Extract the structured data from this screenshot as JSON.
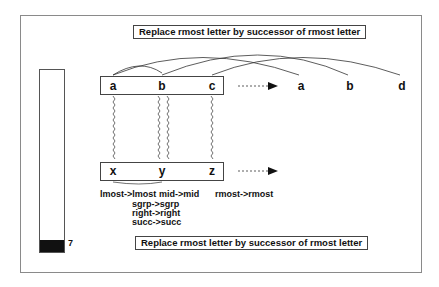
{
  "rule_top": "Replace rmost letter by successor of rmost letter",
  "rule_bottom": "Replace rmost letter by successor of rmost letter",
  "temperature": {
    "value": "7",
    "fill_percent": 7
  },
  "initial_string": [
    "a",
    "b",
    "c"
  ],
  "modified_string": [
    "a",
    "b",
    "d"
  ],
  "target_string": [
    "x",
    "y",
    "z"
  ],
  "answer_string": [],
  "mappings": {
    "row1": [
      "lmost->lmost",
      "mid->mid",
      "rmost->rmost"
    ],
    "under_mid": [
      "sgrp->sgrp",
      "right->right",
      "succ->succ"
    ]
  },
  "icons": {
    "transform_arrow_top": "dashed-arrow-right",
    "transform_arrow_bottom": "dashed-arrow-right",
    "bond": "wavy-line",
    "correspondence": "arc"
  }
}
